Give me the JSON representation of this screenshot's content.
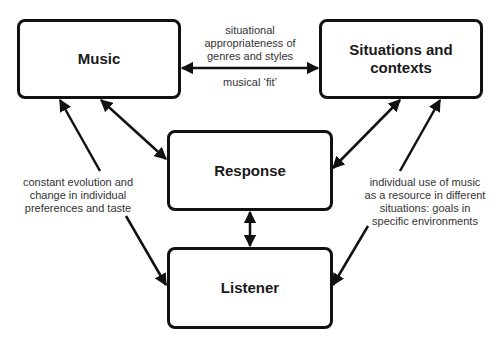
{
  "diagram": {
    "nodes": {
      "music": {
        "label": "Music"
      },
      "situations": {
        "label_line1": "Situations and",
        "label_line2": "contexts"
      },
      "response": {
        "label": "Response"
      },
      "listener": {
        "label": "Listener"
      }
    },
    "edges": [
      {
        "from": "music",
        "to": "situations",
        "type": "bidirectional"
      },
      {
        "from": "music",
        "to": "response",
        "type": "bidirectional"
      },
      {
        "from": "situations",
        "to": "response",
        "type": "bidirectional"
      },
      {
        "from": "response",
        "to": "listener",
        "type": "bidirectional"
      },
      {
        "from": "listener",
        "to": "music",
        "type": "directed"
      },
      {
        "from": "situations",
        "to": "listener",
        "type": "directed"
      }
    ],
    "annotations": {
      "top_above": [
        "situational",
        "appropriateness of",
        "genres and styles"
      ],
      "top_below": "musical ‘fit’",
      "left": [
        "constant evolution and",
        "change in individual",
        "preferences and taste"
      ],
      "right": [
        "individual use of music",
        "as a resource in different",
        "situations: goals in",
        "specific environments"
      ]
    },
    "colors": {
      "stroke": "#111111",
      "text": "#333333",
      "background": "#ffffff"
    }
  }
}
